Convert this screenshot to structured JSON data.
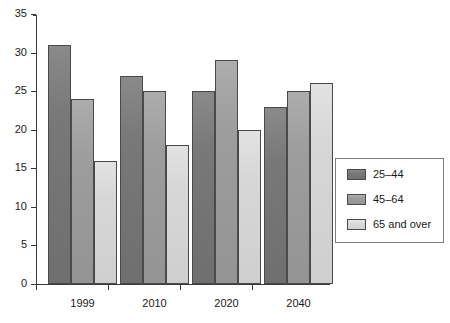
{
  "chart_data": {
    "type": "bar",
    "title": "",
    "subtitle": "",
    "xlabel": "",
    "ylabel": "",
    "categories": [
      "1999",
      "2010",
      "2020",
      "2040"
    ],
    "series": [
      {
        "name": "25–44",
        "color": "#787878",
        "values": [
          31,
          27,
          25,
          23
        ]
      },
      {
        "name": "45–64",
        "color": "#9d9d9d",
        "values": [
          24,
          25,
          29,
          25
        ]
      },
      {
        "name": "65 and over",
        "color": "#d7d7d7",
        "values": [
          16,
          18,
          20,
          26
        ]
      }
    ],
    "ylim": [
      0,
      35
    ],
    "yticks": [
      0,
      5,
      10,
      15,
      20,
      25,
      30,
      35
    ],
    "ytick_labels": [
      "0",
      "5",
      "10",
      "15",
      "20",
      "25",
      "30",
      "35"
    ],
    "grid": false,
    "legend_position": "right",
    "annotations": []
  },
  "legend": {
    "entries": [
      {
        "label": "25–44"
      },
      {
        "label": "45–64"
      },
      {
        "label": "65 and over"
      }
    ]
  }
}
